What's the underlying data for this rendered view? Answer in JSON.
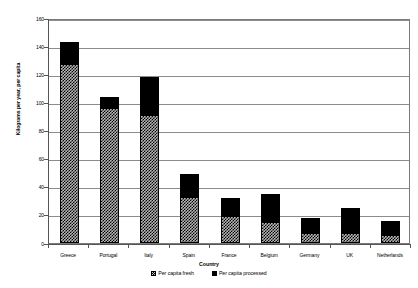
{
  "chart_data": {
    "type": "bar",
    "stacked": true,
    "title": "",
    "xlabel": "Country",
    "ylabel": "Kilograms per year, per capita",
    "ylim": [
      0,
      160
    ],
    "ytick_step": 20,
    "yticks": [
      "0",
      "20",
      "40",
      "60",
      "80",
      "100",
      "120",
      "140",
      "160"
    ],
    "grid": true,
    "legend_position": "bottom",
    "categories": [
      "Greece",
      "Portugal",
      "Italy",
      "Spain",
      "France",
      "Belgium",
      "Germany",
      "UK",
      "Netherlands"
    ],
    "series": [
      {
        "name": "Per capita fresh",
        "pattern": "checkered",
        "color": "#b4b4b4",
        "values": [
          127,
          96,
          91,
          33,
          19,
          15,
          7,
          7,
          6
        ]
      },
      {
        "name": "Per capita processed",
        "pattern": "solid",
        "color": "#000000",
        "values": [
          16,
          8,
          27,
          16,
          13,
          20,
          11,
          18,
          10
        ]
      }
    ],
    "totals": [
      143,
      104,
      118,
      49,
      32,
      35,
      18,
      25,
      16
    ]
  },
  "legend": {
    "items": [
      {
        "label": "Per capita fresh",
        "swatch": "checkered-swatch-icon"
      },
      {
        "label": "Per capita processed",
        "swatch": "solid-swatch-icon"
      }
    ]
  },
  "axes": {
    "y_title": "Kilograms per year, per capita",
    "x_title": "Country"
  }
}
